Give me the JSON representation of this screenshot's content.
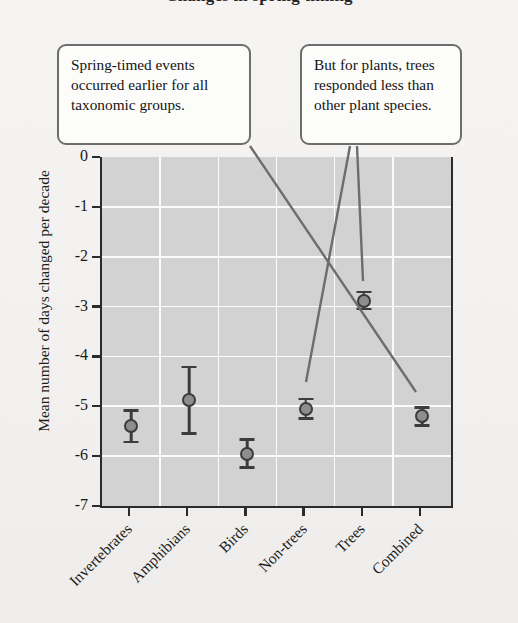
{
  "title": "Changes in spring timing",
  "annotations": [
    {
      "id": "callout-left",
      "text": "Spring-timed events occurred earlier for all taxonomic groups."
    },
    {
      "id": "callout-right",
      "text": "But for plants, trees responded less than other plant species."
    }
  ],
  "chart_data": {
    "type": "scatter",
    "title": "Changes in spring timing",
    "xlabel": "",
    "ylabel": "Mean number of days changed per decade",
    "ylim": [
      -7,
      0
    ],
    "yticks": [
      "0",
      "-1",
      "-2",
      "-3",
      "-4",
      "-5",
      "-6",
      "-7"
    ],
    "ytick_values": [
      0,
      -1,
      -2,
      -3,
      -4,
      -5,
      -6,
      -7
    ],
    "grid": true,
    "legend": "none",
    "error_bars": "symmetric",
    "categories": [
      "Invertebrates",
      "Amphibians",
      "Birds",
      "Non-trees",
      "Trees",
      "Combined"
    ],
    "values": [
      -5.4,
      -4.88,
      -5.95,
      -5.05,
      -2.88,
      -5.2
    ],
    "errors": [
      0.32,
      0.67,
      0.28,
      0.2,
      0.17,
      0.18
    ],
    "series": [
      {
        "name": "Mean days changed per decade",
        "points": [
          {
            "category": "Invertebrates",
            "value": -5.4,
            "error": 0.32,
            "low": -5.72,
            "high": -5.08
          },
          {
            "category": "Amphibians",
            "value": -4.88,
            "error": 0.67,
            "low": -5.55,
            "high": -4.21
          },
          {
            "category": "Birds",
            "value": -5.95,
            "error": 0.28,
            "low": -6.23,
            "high": -5.67
          },
          {
            "category": "Non-trees",
            "value": -5.05,
            "error": 0.2,
            "low": -5.25,
            "high": -4.85
          },
          {
            "category": "Trees",
            "value": -2.88,
            "error": 0.17,
            "low": -3.05,
            "high": -2.71
          },
          {
            "category": "Combined",
            "value": -5.2,
            "error": 0.18,
            "low": -5.38,
            "high": -5.02
          }
        ]
      }
    ],
    "annotations": [
      {
        "text": "Spring-timed events occurred earlier for all taxonomic groups.",
        "points_to": "Combined"
      },
      {
        "text": "But for plants, trees responded less than other plant species.",
        "points_to": "Non-trees, Trees"
      }
    ]
  },
  "colors": {
    "plot_background": "#d2d2d2",
    "gridline": "#fbfbfb",
    "axis": "#2b2b2b",
    "marker_fill": "#8d8d8d",
    "marker_edge": "#3b3b3b",
    "callout_border": "#6d6d6d",
    "callout_background": "#fcfcfb",
    "page_background": "#f4f3f1"
  }
}
